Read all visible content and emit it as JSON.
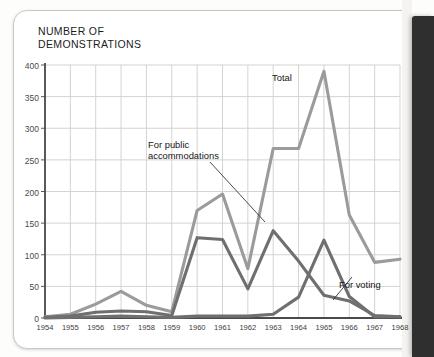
{
  "chart_title": "NUMBER OF\nDEMONSTRATIONS",
  "colors": {
    "total_line": "#9b9b9b",
    "public_accommodations_line": "#6f6f6f",
    "voting_line": "#6f6f6f",
    "gridline": "#d3d3d3",
    "axis": "#4a4a4a",
    "binding_bar": "#2f2f2f"
  },
  "annotations": {
    "total": "Total",
    "public_accommodations": "For public\naccommodations",
    "voting": "For voting"
  },
  "chart_data": {
    "type": "line",
    "title": "NUMBER OF DEMONSTRATIONS",
    "xlabel": "",
    "ylabel": "NUMBER OF DEMONSTRATIONS",
    "x": [
      1954,
      1955,
      1956,
      1957,
      1958,
      1959,
      1960,
      1961,
      1962,
      1963,
      1964,
      1965,
      1966,
      1967,
      1968
    ],
    "xtick_labels": [
      "1954",
      "1955",
      "1956",
      "1957",
      "1958",
      "1959",
      "1960",
      "1961",
      "1962",
      "1963",
      "1964",
      "1965",
      "1966",
      "1967",
      "1968"
    ],
    "ytick_labels": [
      "0",
      "50",
      "100",
      "150",
      "200",
      "250",
      "300",
      "350",
      "400"
    ],
    "yticks": [
      0,
      50,
      100,
      150,
      200,
      250,
      300,
      350,
      400
    ],
    "ylim": [
      0,
      400
    ],
    "xlim": [
      1954,
      1968
    ],
    "grid": true,
    "legend": "inline-annotations",
    "series": [
      {
        "name": "Total",
        "color": "#9b9b9b",
        "values": [
          2,
          6,
          22,
          42,
          20,
          10,
          170,
          196,
          78,
          268,
          268,
          390,
          163,
          88,
          93
        ]
      },
      {
        "name": "For public accommodations",
        "color": "#6f6f6f",
        "values": [
          1,
          3,
          9,
          11,
          10,
          4,
          127,
          124,
          46,
          138,
          90,
          36,
          27,
          4,
          2
        ]
      },
      {
        "name": "For voting",
        "color": "#6f6f6f",
        "values": [
          0,
          1,
          2,
          3,
          2,
          1,
          3,
          3,
          3,
          6,
          33,
          123,
          34,
          2,
          2
        ]
      }
    ]
  }
}
